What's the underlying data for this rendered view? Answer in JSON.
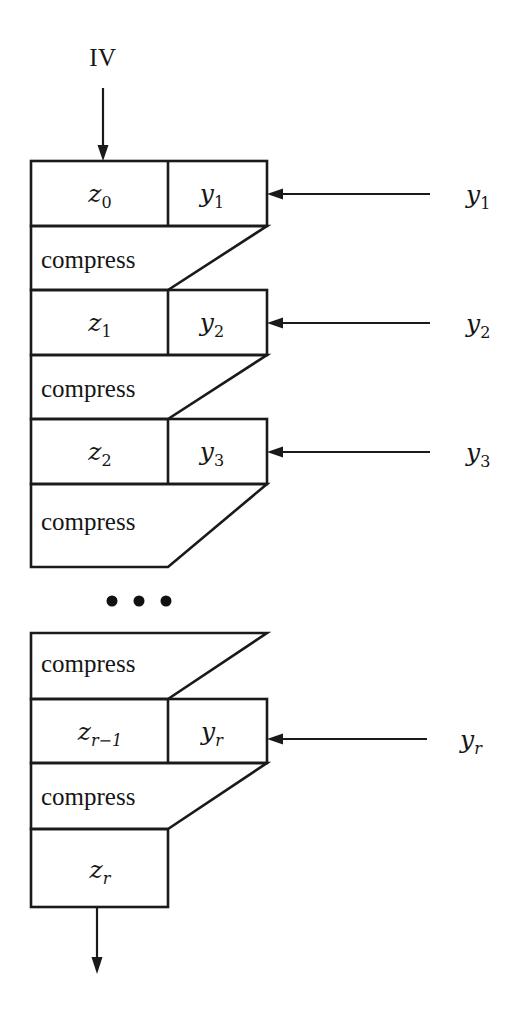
{
  "figure": {
    "background_color": "#ffffff",
    "line_color": "#1a1a1a"
  },
  "inputs": {
    "iv_label": "IV"
  },
  "stages": [
    {
      "id": "stage-1",
      "state_label": "z",
      "state_sub": "0",
      "message_label": "y",
      "message_sub": "1",
      "compress_label": "compress",
      "side_input_label": "y",
      "side_input_sub": "1"
    },
    {
      "id": "stage-2",
      "state_label": "z",
      "state_sub": "1",
      "message_label": "y",
      "message_sub": "2",
      "compress_label": "compress",
      "side_input_label": "y",
      "side_input_sub": "2"
    },
    {
      "id": "stage-3",
      "state_label": "z",
      "state_sub": "2",
      "message_label": "y",
      "message_sub": "3",
      "compress_label": "compress",
      "side_input_label": "y",
      "side_input_sub": "3"
    }
  ],
  "ellipsis": {
    "glyph": "• • •",
    "dot_count": 3
  },
  "final_stage": {
    "id": "stage-r",
    "upper_compress_label": "compress",
    "state_label": "z",
    "state_sub": "r−1",
    "message_label": "y",
    "message_sub": "r",
    "lower_compress_label": "compress",
    "side_input_label": "y",
    "side_input_sub": "r",
    "output_label": "z",
    "output_sub": "r"
  }
}
